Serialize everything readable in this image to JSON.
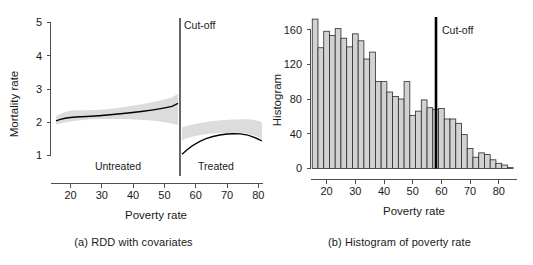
{
  "figure": {
    "panels": [
      {
        "id": "panel-a",
        "caption": "(a) RDD with covariates",
        "ylabel": "Mortality rate",
        "xlabel": "Poverty rate",
        "cutoff_label": "Cut-off",
        "left_region_label": "Untreated",
        "right_region_label": "Treated"
      },
      {
        "id": "panel-b",
        "caption": "(b) Histogram of poverty rate",
        "ylabel": "Histogram",
        "xlabel": "Poverty rate",
        "cutoff_label": "Cut-off"
      }
    ]
  },
  "chart_data": [
    {
      "type": "line",
      "title": "(a) RDD with covariates",
      "xlabel": "Poverty rate",
      "ylabel": "Mortality rate",
      "xlim": [
        13,
        83
      ],
      "ylim": [
        0.6,
        5
      ],
      "xticks": [
        20,
        30,
        40,
        50,
        60,
        70,
        80
      ],
      "yticks": [
        1,
        2,
        3,
        4,
        5
      ],
      "grid": false,
      "legend": null,
      "annotations": [
        {
          "text": "Cut-off",
          "x": 60,
          "y": 4.6
        },
        {
          "text": "Untreated",
          "x": 36,
          "y": 0.95
        },
        {
          "text": "Treated",
          "x": 68,
          "y": 0.95
        }
      ],
      "cutoff": 59.3,
      "series": [
        {
          "name": "Untreated fit",
          "x": [
            14.0,
            16.0,
            18.0,
            20.0,
            22.0,
            25.0,
            28.0,
            31.0,
            34.0,
            37.0,
            40.0,
            43.0,
            46.0,
            49.0,
            52.0,
            55.0,
            57.0,
            59.3
          ],
          "values": [
            2.27,
            2.19,
            2.13,
            2.11,
            2.12,
            2.17,
            2.22,
            2.27,
            2.32,
            2.37,
            2.39,
            2.42,
            2.46,
            2.51,
            2.58,
            2.67,
            2.74,
            2.82
          ],
          "ci_lower": [
            1.84,
            1.89,
            1.93,
            1.96,
            1.98,
            2.03,
            2.08,
            2.13,
            2.18,
            2.23,
            2.26,
            2.28,
            2.29,
            2.28,
            2.25,
            2.2,
            2.12,
            1.98
          ],
          "ci_upper": [
            2.73,
            2.53,
            2.36,
            2.28,
            2.27,
            2.32,
            2.37,
            2.42,
            2.47,
            2.52,
            2.55,
            2.6,
            2.68,
            2.8,
            2.96,
            3.2,
            3.45,
            3.92
          ]
        },
        {
          "name": "Treated fit",
          "x": [
            59.3,
            61.0,
            63.0,
            65.0,
            67.0,
            69.0,
            71.0,
            73.0,
            75.0,
            77.0,
            79.0,
            81.0,
            82.5
          ],
          "values": [
            1.28,
            1.43,
            1.58,
            1.69,
            1.76,
            1.8,
            1.81,
            1.79,
            1.76,
            1.73,
            1.68,
            1.58,
            1.5
          ],
          "ci_lower": [
            0.62,
            0.96,
            1.2,
            1.37,
            1.48,
            1.55,
            1.58,
            1.57,
            1.53,
            1.47,
            1.36,
            1.16,
            0.98
          ],
          "ci_upper": [
            1.96,
            1.9,
            1.95,
            2.01,
            2.05,
            2.07,
            2.07,
            2.05,
            2.03,
            2.03,
            2.1,
            2.3,
            2.55
          ]
        }
      ]
    },
    {
      "type": "bar",
      "title": "(b) Histogram of poverty rate",
      "xlabel": "Poverty rate",
      "ylabel": "Histogram",
      "xlim": [
        14,
        86
      ],
      "ylim": [
        0,
        180
      ],
      "xticks": [
        20,
        30,
        40,
        50,
        60,
        70,
        80
      ],
      "yticks": [
        0,
        40,
        80,
        120,
        160
      ],
      "grid": false,
      "bin_width": 2,
      "cutoff": 59.3,
      "annotations": [
        {
          "text": "Cut-off",
          "x": 60,
          "y": 158
        }
      ],
      "categories": [
        16,
        18,
        20,
        22,
        24,
        26,
        28,
        30,
        32,
        34,
        36,
        38,
        40,
        42,
        44,
        46,
        48,
        50,
        52,
        54,
        56,
        58,
        60,
        62,
        64,
        66,
        68,
        70,
        72,
        74,
        76,
        78,
        80,
        82,
        84
      ],
      "values": [
        172,
        139,
        158,
        153,
        161,
        150,
        140,
        155,
        147,
        126,
        134,
        100,
        100,
        88,
        83,
        80,
        100,
        61,
        66,
        79,
        70,
        68,
        69,
        57,
        57,
        52,
        39,
        23,
        13,
        18,
        16,
        10,
        6,
        4,
        1
      ]
    }
  ]
}
